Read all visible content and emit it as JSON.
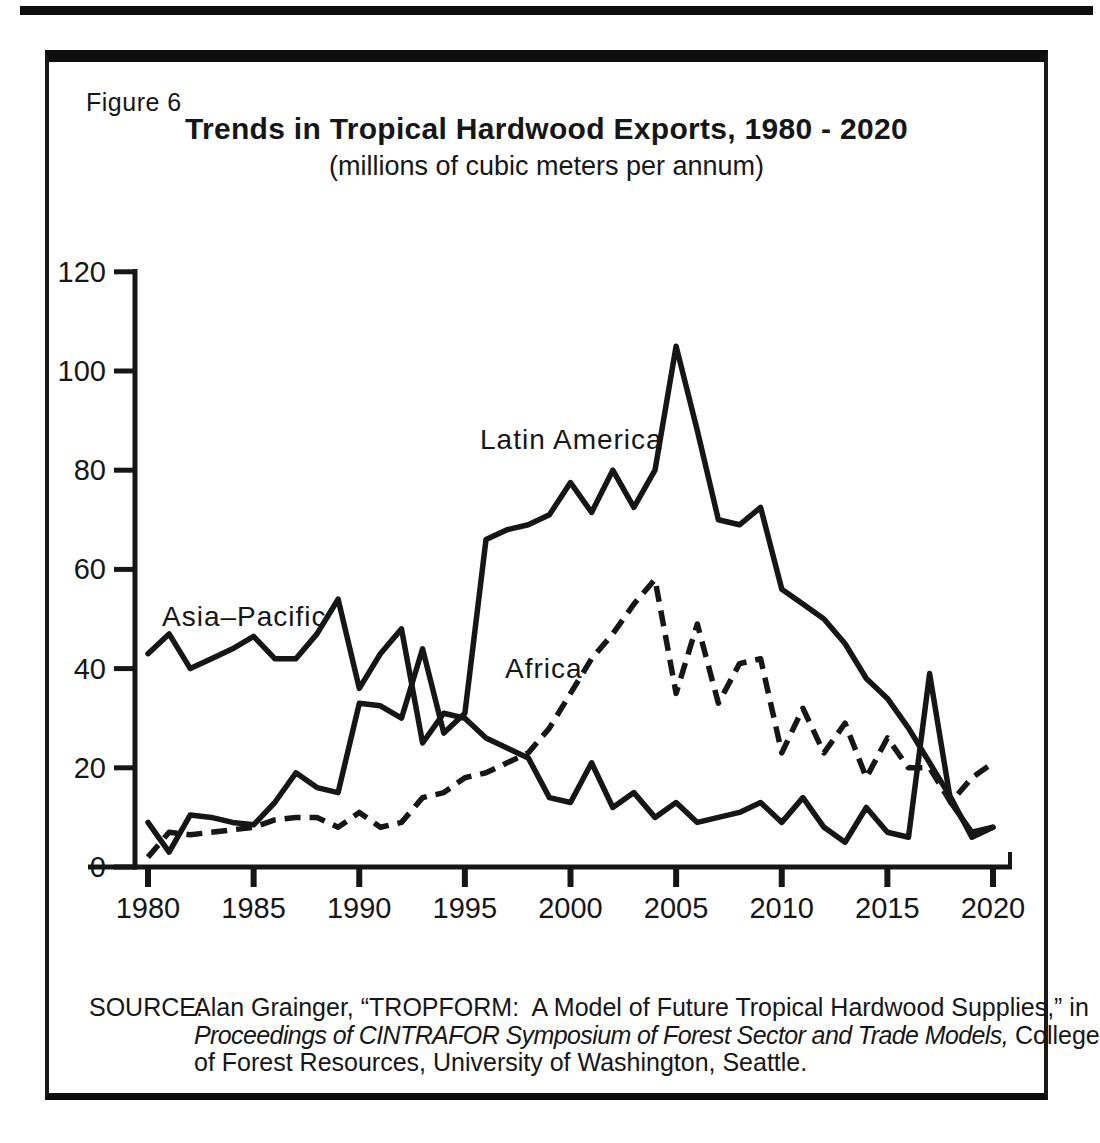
{
  "figure_label": "Figure 6",
  "title": "Trends in Tropical Hardwood Exports, 1980 - 2020",
  "subtitle": "(millions of cubic meters per annum)",
  "source": {
    "label": "SOURCE:",
    "line1": "Alan Grainger, “TROPFORM:  A Model of Future Tropical Hardwood Supplies,” in",
    "line2_italic": "Proceedings of CINTRAFOR Symposium of Forest Sector and Trade Models,",
    "line2_regular": " College",
    "line3": "of Forest Resources, University of Washington, Seattle."
  },
  "chart_data": {
    "type": "line",
    "title": "Trends in Tropical Hardwood Exports, 1980 - 2020",
    "subtitle": "(millions of cubic meters per annum)",
    "xlabel": "",
    "ylabel": "millions of cubic meters per annum",
    "xlim": [
      1980,
      2020
    ],
    "ylim": [
      0,
      120
    ],
    "xticks": [
      1980,
      1985,
      1990,
      1995,
      2000,
      2005,
      2010,
      2015,
      2020
    ],
    "yticks": [
      0,
      20,
      40,
      60,
      80,
      100,
      120
    ],
    "grid": false,
    "legend_position": "inline-labels",
    "line_color": "#161616",
    "years": [
      1980,
      1981,
      1982,
      1983,
      1984,
      1985,
      1986,
      1987,
      1988,
      1989,
      1990,
      1991,
      1992,
      1993,
      1994,
      1995,
      1996,
      1997,
      1998,
      1999,
      2000,
      2001,
      2002,
      2003,
      2004,
      2005,
      2006,
      2007,
      2008,
      2009,
      2010,
      2011,
      2012,
      2013,
      2014,
      2015,
      2016,
      2017,
      2018,
      2019,
      2020
    ],
    "series": [
      {
        "id": "asia-pacific",
        "name": "Asia-Pacific",
        "label_text": "Asia–Pacific",
        "style": "solid",
        "values": [
          43,
          47,
          40,
          42,
          44,
          46.5,
          42,
          42,
          47,
          54,
          36,
          43,
          48,
          25,
          31,
          30,
          26,
          24,
          22,
          14,
          13,
          21,
          12,
          15,
          10,
          13,
          9,
          10,
          11,
          13,
          9,
          14,
          8,
          5,
          12,
          7,
          6,
          39,
          13,
          7,
          8
        ]
      },
      {
        "id": "latin-america",
        "name": "Latin America",
        "label_text": "Latin America",
        "style": "solid",
        "values": [
          9,
          3,
          10.5,
          10,
          9,
          8.5,
          13,
          19,
          16,
          15,
          33,
          32.5,
          30,
          44,
          27,
          31,
          66,
          68,
          69,
          71,
          77.5,
          71.5,
          80,
          72.5,
          80,
          105,
          88,
          70,
          69,
          72.5,
          56,
          53,
          50,
          45,
          38,
          34,
          28,
          21,
          14,
          6,
          8
        ]
      },
      {
        "id": "africa",
        "name": "Africa",
        "label_text": "Africa",
        "style": "dashed",
        "values": [
          2,
          7,
          6.5,
          7,
          7.5,
          8,
          9.5,
          10,
          10,
          8,
          11,
          8,
          9,
          14,
          15,
          18,
          19,
          21,
          23,
          28,
          35,
          42,
          47,
          53,
          58,
          35,
          49,
          33,
          41,
          42,
          23,
          32,
          23,
          29,
          18,
          26,
          20,
          20,
          13,
          18,
          21
        ]
      }
    ]
  }
}
